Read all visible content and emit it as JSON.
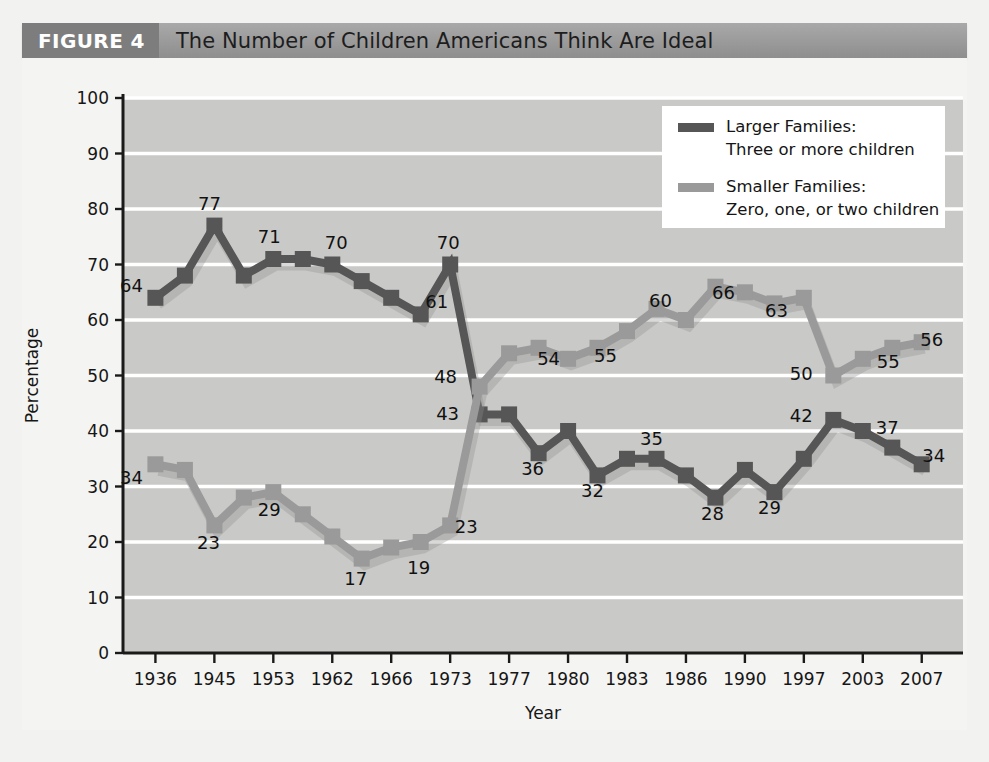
{
  "figure": {
    "tag": "FIGURE 4",
    "title": "The Number of Children Americans Think Are Ideal"
  },
  "legend": {
    "position": "top-right",
    "entries": [
      {
        "swatch_color": "#565656",
        "line1": "Larger Families:",
        "line2": "Three or more children"
      },
      {
        "swatch_color": "#9a9a9a",
        "line1": "Smaller Families:",
        "line2": "Zero, one, or two children"
      }
    ]
  },
  "chart_data": {
    "type": "line",
    "title": "The Number of Children Americans Think Are Ideal",
    "xlabel": "Year",
    "ylabel": "Percentage",
    "ylim": [
      0,
      100
    ],
    "yticks": [
      0,
      10,
      20,
      30,
      40,
      50,
      60,
      70,
      80,
      90,
      100
    ],
    "xticks": [
      "1936",
      "1945",
      "1953",
      "1962",
      "1966",
      "1973",
      "1977",
      "1980",
      "1983",
      "1986",
      "1990",
      "1997",
      "2003",
      "2007"
    ],
    "grid": "horizontal",
    "legend_position": "top-right",
    "x": [
      0,
      1,
      2,
      3,
      4,
      5,
      6,
      7,
      8,
      9,
      10,
      11,
      12,
      13,
      14,
      15,
      16,
      17,
      18,
      19,
      20,
      21,
      22,
      23,
      24,
      25,
      26
    ],
    "series": [
      {
        "name": "Larger Families: Three or more children",
        "color": "#565656",
        "values": [
          64,
          68,
          77,
          68,
          71,
          71,
          70,
          67,
          64,
          61,
          70,
          43,
          43,
          36,
          40,
          32,
          35,
          35,
          32,
          28,
          33,
          29,
          35,
          42,
          40,
          37,
          34
        ],
        "labeled_points": [
          {
            "index": 0,
            "value": 64,
            "label": "64"
          },
          {
            "index": 2,
            "value": 77,
            "label": "77"
          },
          {
            "index": 4,
            "value": 71,
            "label": "71"
          },
          {
            "index": 6,
            "value": 70,
            "label": "70"
          },
          {
            "index": 9,
            "value": 61,
            "label": "61"
          },
          {
            "index": 10,
            "value": 70,
            "label": "70"
          },
          {
            "index": 11,
            "value": 43,
            "label": "43"
          },
          {
            "index": 13,
            "value": 36,
            "label": "36"
          },
          {
            "index": 15,
            "value": 32,
            "label": "32"
          },
          {
            "index": 17,
            "value": 35,
            "label": "35"
          },
          {
            "index": 19,
            "value": 28,
            "label": "28"
          },
          {
            "index": 21,
            "value": 29,
            "label": "29"
          },
          {
            "index": 23,
            "value": 42,
            "label": "42"
          },
          {
            "index": 25,
            "value": 37,
            "label": "37"
          },
          {
            "index": 26,
            "value": 34,
            "label": "34"
          }
        ]
      },
      {
        "name": "Smaller Families: Zero, one, or two children",
        "color": "#9a9a9a",
        "values": [
          34,
          33,
          23,
          28,
          29,
          25,
          21,
          17,
          19,
          20,
          23,
          48,
          54,
          55,
          53,
          55,
          58,
          62,
          60,
          66,
          65,
          63,
          64,
          50,
          53,
          55,
          56
        ],
        "labeled_points": [
          {
            "index": 0,
            "value": 34,
            "label": "34"
          },
          {
            "index": 2,
            "value": 23,
            "label": "23"
          },
          {
            "index": 4,
            "value": 29,
            "label": "29"
          },
          {
            "index": 7,
            "value": 17,
            "label": "17"
          },
          {
            "index": 9,
            "value": 19,
            "label": "19"
          },
          {
            "index": 10,
            "value": 23,
            "label": "23"
          },
          {
            "index": 11,
            "value": 48,
            "label": "48"
          },
          {
            "index": 13,
            "value": 54,
            "label": "54"
          },
          {
            "index": 15,
            "value": 55,
            "label": "55"
          },
          {
            "index": 17,
            "value": 60,
            "label": "60"
          },
          {
            "index": 19,
            "value": 66,
            "label": "66"
          },
          {
            "index": 21,
            "value": 63,
            "label": "63"
          },
          {
            "index": 23,
            "value": 50,
            "label": "50"
          },
          {
            "index": 25,
            "value": 55,
            "label": "55"
          },
          {
            "index": 26,
            "value": 56,
            "label": "56"
          }
        ]
      }
    ]
  },
  "label_offsets": {
    "larger": {
      "0": [
        -24,
        -6
      ],
      "2": [
        -5,
        -16
      ],
      "4": [
        -4,
        -16
      ],
      "6": [
        4,
        -16
      ],
      "9": [
        16,
        -6
      ],
      "10": [
        -2,
        -16
      ],
      "11": [
        -32,
        6
      ],
      "13": [
        -6,
        22
      ],
      "15": [
        -5,
        22
      ],
      "17": [
        -5,
        -14
      ],
      "19": [
        -3,
        22
      ],
      "21": [
        -5,
        22
      ],
      "23": [
        -32,
        2
      ],
      "25": [
        -5,
        -14
      ],
      "26": [
        12,
        -2
      ]
    },
    "smaller": {
      "0": [
        -24,
        20
      ],
      "2": [
        -6,
        24
      ],
      "4": [
        -4,
        24
      ],
      "7": [
        -6,
        26
      ],
      "9": [
        -2,
        26
      ],
      "10": [
        16,
        8
      ],
      "11": [
        -34,
        -4
      ],
      "13": [
        10,
        12
      ],
      "15": [
        8,
        14
      ],
      "17": [
        4,
        -13
      ],
      "19": [
        8,
        12
      ],
      "21": [
        2,
        14
      ],
      "23": [
        -32,
        4
      ],
      "25": [
        -4,
        20
      ],
      "26": [
        10,
        4
      ]
    }
  }
}
